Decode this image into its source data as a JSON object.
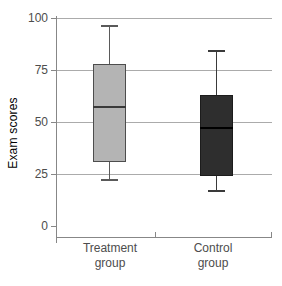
{
  "figure": {
    "background": "#ffffff"
  },
  "chart_data": {
    "type": "boxplot",
    "title": "",
    "ylabel": "Exam scores",
    "xlabel": "",
    "ylim": [
      0,
      100
    ],
    "yticks": [
      0,
      25,
      50,
      75,
      100
    ],
    "gridlines": [
      25,
      50,
      75,
      100
    ],
    "grid": "horizontal",
    "legend": "none",
    "categories": [
      "Treatment group",
      "Control group"
    ],
    "series": [
      {
        "name": "Treatment group",
        "label_lines": [
          "Treatment",
          "group"
        ],
        "min": 22,
        "q1": 31,
        "median": 57,
        "q3": 78,
        "max": 96,
        "fill": "#b4b4b4",
        "border": "#4d4d4d",
        "median_color": "#3a3a3a",
        "whisker_color": "#5a5a5a"
      },
      {
        "name": "Control group",
        "label_lines": [
          "Control",
          "group"
        ],
        "min": 17,
        "q1": 24,
        "median": 47,
        "q3": 63,
        "max": 84,
        "fill": "#2e2e2e",
        "border": "#1c1c1c",
        "median_color": "#000000",
        "whisker_color": "#3a3a3a"
      }
    ],
    "colors": {
      "gridline": "#ababab",
      "axis": "#878787",
      "text": "#4d4d4d"
    }
  }
}
